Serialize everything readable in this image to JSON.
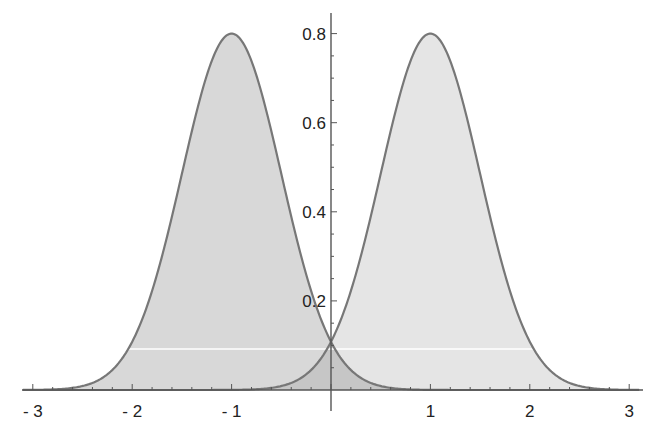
{
  "chart_data": {
    "type": "area",
    "title": "",
    "xlabel": "",
    "ylabel": "",
    "xlim": [
      -3.1,
      3.1
    ],
    "ylim": [
      0,
      0.85
    ],
    "grid": false,
    "legend": null,
    "x_ticks": [
      -3,
      -2,
      -1,
      1,
      2,
      3
    ],
    "x_tick_labels": [
      "- 3",
      "- 2",
      "- 1",
      "1",
      "2",
      "3"
    ],
    "y_ticks": [
      0.2,
      0.4,
      0.6,
      0.8
    ],
    "y_tick_labels": [
      "0.2",
      "0.4",
      "0.6",
      "0.8"
    ],
    "series": [
      {
        "name": "left-gaussian",
        "distribution": "normal",
        "mean": -1,
        "sd": 0.5,
        "peak": 0.8,
        "fill": "#d4d4d4",
        "stroke": "#777777",
        "points": [
          {
            "x": -3,
            "y": 0.0003
          },
          {
            "x": -2.5,
            "y": 0.009
          },
          {
            "x": -2,
            "y": 0.108
          },
          {
            "x": -1.5,
            "y": 0.484
          },
          {
            "x": -1,
            "y": 0.798
          },
          {
            "x": -0.5,
            "y": 0.484
          },
          {
            "x": 0,
            "y": 0.108
          },
          {
            "x": 0.5,
            "y": 0.009
          },
          {
            "x": 1,
            "y": 0.0003
          }
        ]
      },
      {
        "name": "right-gaussian",
        "distribution": "normal",
        "mean": 1,
        "sd": 0.5,
        "peak": 0.8,
        "fill": "#e2e2e2",
        "stroke": "#777777",
        "points": [
          {
            "x": -1,
            "y": 0.0003
          },
          {
            "x": -0.5,
            "y": 0.009
          },
          {
            "x": 0,
            "y": 0.108
          },
          {
            "x": 0.5,
            "y": 0.484
          },
          {
            "x": 1,
            "y": 0.798
          },
          {
            "x": 1.5,
            "y": 0.484
          },
          {
            "x": 2,
            "y": 0.108
          },
          {
            "x": 2.5,
            "y": 0.009
          },
          {
            "x": 3,
            "y": 0.0003
          }
        ]
      }
    ],
    "annotations": [
      {
        "type": "hline",
        "y": 0.092,
        "x_from": -2.04,
        "x_to": 2.04,
        "color": "#ffffff"
      }
    ],
    "intersection": {
      "x": 0,
      "y": 0.108
    }
  },
  "colors": {
    "background": "#ffffff",
    "axis": "#555555",
    "overlap_fill": "#c6c6c6"
  }
}
